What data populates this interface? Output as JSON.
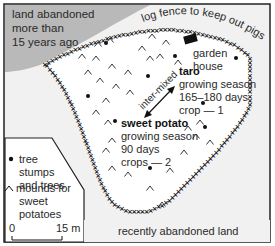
{
  "old_land": {
    "label_lines": [
      "land abandoned",
      "more than",
      "15 years ago"
    ],
    "fill": "#b9b9b9"
  },
  "fence_label": "log fence to keep out pigs",
  "garden_house": {
    "lines": [
      "garden",
      "house"
    ]
  },
  "intermix_label": "inter-mixed",
  "taro": {
    "title": "taro",
    "lines": [
      "growing season",
      "165–180 days",
      "crop — 1"
    ]
  },
  "sweet_potato": {
    "title": "sweet potato",
    "lines": [
      "growing season",
      "90 days",
      "crops — 2"
    ]
  },
  "legend": {
    "tree": {
      "symbol": "•",
      "lines": [
        "tree",
        "stumps",
        "and trees"
      ]
    },
    "mound": {
      "symbol": "^",
      "lines": [
        "mounds for",
        "sweet",
        "potatoes"
      ]
    }
  },
  "scale": {
    "start": "0",
    "end": "15 m"
  },
  "recent_land_label": "recently abandoned land",
  "colors": {
    "background": "#f2f2f2",
    "garden": "#ffffff",
    "ink": "#1a1a1a"
  }
}
